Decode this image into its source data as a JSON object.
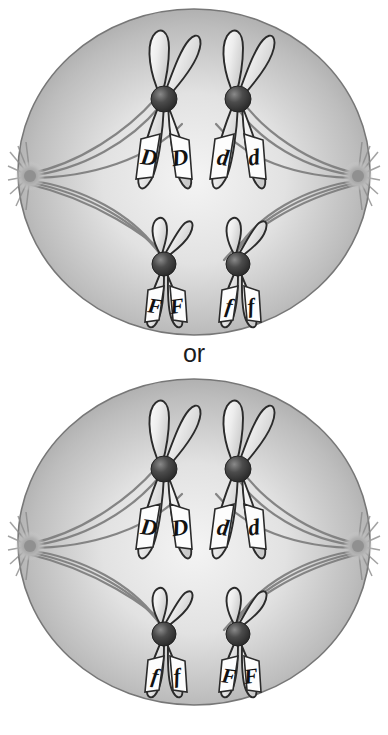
{
  "figure": {
    "connector_label": "or",
    "background_color": "#ffffff",
    "cell_fill_center": "#e9e9e9",
    "cell_fill_edge": "#9c9c9c",
    "cell_outline": "#6f6f6f",
    "chromosome_fill": "#f2f2f2",
    "chromosome_outline": "#2b2b2b",
    "centromere_color": "#3a3a3a",
    "spindle_color": "#7b7b7b",
    "label_text_color": "#111111",
    "label_band_fill": "#fdfdfd"
  },
  "cells": [
    {
      "id": "cell-top",
      "name": "Arrangement 1",
      "chromosomes": [
        {
          "id": "top-left-long",
          "arm_type": "long",
          "side": "left",
          "row": "upper",
          "alleles": [
            "D",
            "D"
          ]
        },
        {
          "id": "top-right-long",
          "arm_type": "long",
          "side": "right",
          "row": "upper",
          "alleles": [
            "d",
            "d"
          ]
        },
        {
          "id": "top-left-short",
          "arm_type": "short",
          "side": "left",
          "row": "lower",
          "alleles": [
            "F",
            "F"
          ]
        },
        {
          "id": "top-right-short",
          "arm_type": "short",
          "side": "right",
          "row": "lower",
          "alleles": [
            "f",
            "f"
          ]
        }
      ],
      "poles": [
        "left-pole",
        "right-pole"
      ]
    },
    {
      "id": "cell-bottom",
      "name": "Arrangement 2",
      "chromosomes": [
        {
          "id": "bot-left-long",
          "arm_type": "long",
          "side": "left",
          "row": "upper",
          "alleles": [
            "D",
            "D"
          ]
        },
        {
          "id": "bot-right-long",
          "arm_type": "long",
          "side": "right",
          "row": "upper",
          "alleles": [
            "d",
            "d"
          ]
        },
        {
          "id": "bot-left-short",
          "arm_type": "short",
          "side": "left",
          "row": "lower",
          "alleles": [
            "f",
            "f"
          ]
        },
        {
          "id": "bot-right-short",
          "arm_type": "short",
          "side": "right",
          "row": "lower",
          "alleles": [
            "F",
            "F"
          ]
        }
      ],
      "poles": [
        "left-pole",
        "right-pole"
      ]
    }
  ],
  "allele_text": {
    "top": {
      "long_left_a": "D",
      "long_left_b": "D",
      "long_right_a": "d",
      "long_right_b": "d",
      "short_left_a": "F",
      "short_left_b": "F",
      "short_right_a": "f",
      "short_right_b": "f"
    },
    "bottom": {
      "long_left_a": "D",
      "long_left_b": "D",
      "long_right_a": "d",
      "long_right_b": "d",
      "short_left_a": "f",
      "short_left_b": "f",
      "short_right_a": "F",
      "short_right_b": "F"
    }
  }
}
